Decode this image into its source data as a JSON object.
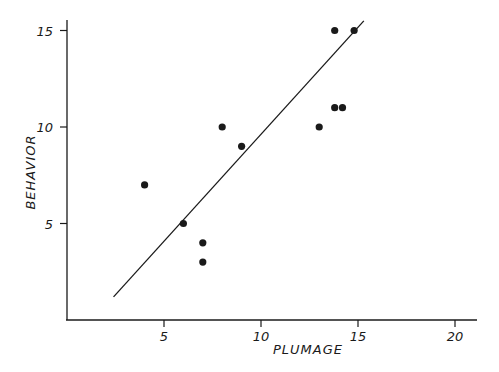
{
  "chart_data": {
    "type": "scatter",
    "title": "",
    "xlabel": "PLUMAGE",
    "ylabel": "BEHAVIOR",
    "xlim": [
      0,
      21
    ],
    "ylim": [
      0,
      15.5
    ],
    "x_ticks": [
      5,
      10,
      15,
      20
    ],
    "y_ticks": [
      5,
      10,
      15
    ],
    "x_tick_labels": [
      "5",
      "10",
      "15",
      "20"
    ],
    "y_tick_labels": [
      "5",
      "10",
      "15"
    ],
    "grid": false,
    "legend": null,
    "series": [
      {
        "name": "observations",
        "points": [
          {
            "x": 4,
            "y": 7
          },
          {
            "x": 6,
            "y": 5
          },
          {
            "x": 7,
            "y": 4
          },
          {
            "x": 7,
            "y": 3
          },
          {
            "x": 8,
            "y": 10
          },
          {
            "x": 9,
            "y": 9
          },
          {
            "x": 13,
            "y": 10
          },
          {
            "x": 13.8,
            "y": 11
          },
          {
            "x": 14.2,
            "y": 11
          },
          {
            "x": 13.8,
            "y": 15
          },
          {
            "x": 14.8,
            "y": 15
          }
        ]
      }
    ],
    "fit_line": {
      "name": "regression line",
      "start": {
        "x": 2.4,
        "y": 1.2
      },
      "end": {
        "x": 15.3,
        "y": 15.5
      }
    }
  },
  "colors": {
    "ink": "#1a1a1a",
    "background": "#ffffff"
  }
}
